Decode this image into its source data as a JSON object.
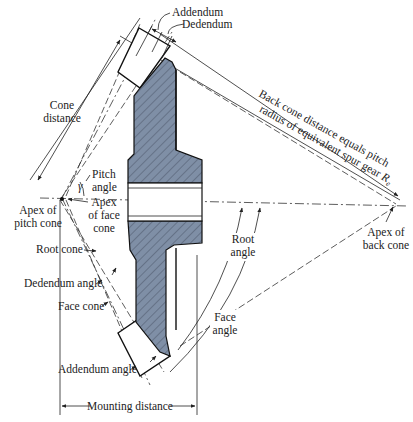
{
  "diagram": {
    "colors": {
      "gear_fill": "#7f8fa6",
      "line": "#222222",
      "background": "#ffffff"
    },
    "labels": {
      "addendum": "Addendum",
      "dedendum": "Dedendum",
      "back_cone_line1": "Back cone distance equals pitch",
      "back_cone_line2": "radius of equivalent spur gear",
      "back_cone_symbol": "R",
      "back_cone_subscript": "e",
      "cone_distance_1": "Cone",
      "cone_distance_2": "distance",
      "pitch_angle_1": "Pitch",
      "pitch_angle_2": "angle",
      "gamma": "γ",
      "apex_pitch_1": "Apex of",
      "apex_pitch_2": "pitch cone",
      "apex_face_1": "Apex",
      "apex_face_2": "of face",
      "apex_face_3": "cone",
      "root_cone": "Root cone",
      "dedendum_angle": "Dedendum angle",
      "face_cone": "Face cone",
      "addendum_angle": "Addendum angle",
      "mounting_distance": "Mounting distance",
      "root_angle_1": "Root",
      "root_angle_2": "angle",
      "face_angle_1": "Face",
      "face_angle_2": "angle",
      "apex_back_1": "Apex of",
      "apex_back_2": "back cone"
    }
  }
}
